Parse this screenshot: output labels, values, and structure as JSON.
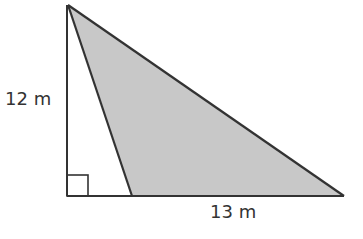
{
  "diagram": {
    "type": "geometry-figure",
    "labels": {
      "height": "12 m",
      "base": "13 m"
    },
    "colors": {
      "shade": "#c8c8c8",
      "stroke": "#333333",
      "text": "#333333"
    },
    "points": {
      "apex": [
        68,
        5
      ],
      "right_angle_corner": [
        67,
        196
      ],
      "shaded_left_base": [
        132,
        196
      ],
      "right_vertex": [
        344,
        196
      ]
    }
  }
}
